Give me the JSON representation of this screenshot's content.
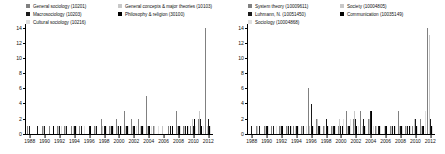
{
  "figure": {
    "panels": [
      {
        "name": "left-panel",
        "legend": [
          {
            "label": "General sociology (10201)",
            "color": "#808080"
          },
          {
            "label": "General concepts & major theories (10103)",
            "color": "#c8c8c8"
          },
          {
            "label": "Macrosociology (10203)",
            "color": "#1a1a1a"
          },
          {
            "label": "Philosophy & religion (30100)",
            "color": "#000000"
          },
          {
            "label": "Cultural sociology (10216)",
            "color": "#e0e0e0"
          }
        ],
        "chart_data": {
          "type": "bar",
          "title": "",
          "xlabel": "",
          "ylabel": "",
          "ylim": [
            0,
            14.5
          ],
          "yticks": [
            0,
            2,
            4,
            6,
            8,
            10,
            12,
            14
          ],
          "grid": false,
          "legend_position": "top",
          "categories": [
            1988,
            1989,
            1990,
            1991,
            1992,
            1993,
            1994,
            1995,
            1996,
            1997,
            1998,
            1999,
            2000,
            2001,
            2002,
            2003,
            2004,
            2005,
            2006,
            2007,
            2008,
            2009,
            2010,
            2011,
            2012
          ],
          "series": [
            {
              "name": "General sociology (10201)",
              "color": "#808080",
              "values": [
                1,
                0,
                1,
                1,
                1,
                1,
                1,
                1,
                0,
                1,
                2,
                1,
                2,
                3,
                2,
                2,
                5,
                1,
                0,
                1,
                3,
                1,
                1,
                2,
                14
              ]
            },
            {
              "name": "General concepts & major theories (10103)",
              "color": "#c8c8c8",
              "values": [
                0,
                0,
                1,
                0,
                1,
                1,
                1,
                0,
                0,
                1,
                1,
                1,
                1,
                1,
                1,
                1,
                1,
                1,
                1,
                0,
                1,
                1,
                2,
                3,
                1
              ]
            },
            {
              "name": "Macrosociology (10203)",
              "color": "#1a1a1a",
              "values": [
                1,
                1,
                1,
                0,
                1,
                1,
                1,
                1,
                1,
                1,
                1,
                1,
                1,
                1,
                1,
                1,
                1,
                0,
                0,
                1,
                1,
                1,
                1,
                2,
                2
              ]
            },
            {
              "name": "Philosophy & religion (30100)",
              "color": "#000000",
              "values": [
                0,
                0,
                0,
                1,
                0,
                0,
                1,
                0,
                1,
                0,
                1,
                1,
                1,
                1,
                1,
                1,
                1,
                0,
                0,
                1,
                1,
                1,
                2,
                1,
                1
              ]
            },
            {
              "name": "Cultural sociology (10216)",
              "color": "#e0e0e0",
              "values": [
                0,
                0,
                0,
                0,
                1,
                0,
                1,
                1,
                0,
                0,
                1,
                1,
                1,
                1,
                1,
                1,
                1,
                1,
                0,
                0,
                1,
                1,
                1,
                1,
                1
              ]
            }
          ]
        },
        "xticks": [
          1988,
          1990,
          1992,
          1994,
          1996,
          1998,
          2000,
          2002,
          2004,
          2006,
          2008,
          2010,
          2012
        ]
      },
      {
        "name": "right-panel",
        "legend": [
          {
            "label": "System theory (10009611)",
            "color": "#808080"
          },
          {
            "label": "Society (10004805)",
            "color": "#c8c8c8"
          },
          {
            "label": "Luhmann, N. (10051450)",
            "color": "#1a1a1a"
          },
          {
            "label": "Communication (10035149)",
            "color": "#000000"
          },
          {
            "label": "Sociology (10004868)",
            "color": "#e0e0e0"
          }
        ],
        "chart_data": {
          "type": "bar",
          "title": "",
          "xlabel": "",
          "ylabel": "",
          "ylim": [
            0,
            14.5
          ],
          "yticks": [
            0,
            2,
            4,
            6,
            8,
            10,
            12,
            14
          ],
          "grid": false,
          "legend_position": "top",
          "categories": [
            1988,
            1989,
            1990,
            1991,
            1992,
            1993,
            1994,
            1995,
            1996,
            1997,
            1998,
            1999,
            2000,
            2001,
            2002,
            2003,
            2004,
            2005,
            2006,
            2007,
            2008,
            2009,
            2010,
            2011,
            2012
          ],
          "series": [
            {
              "name": "System theory (10009611)",
              "color": "#808080",
              "values": [
                0,
                1,
                1,
                1,
                1,
                1,
                1,
                1,
                6,
                2,
                1,
                1,
                1,
                3,
                2,
                3,
                2,
                1,
                0,
                1,
                3,
                1,
                1,
                2,
                14
              ]
            },
            {
              "name": "Society (10004805)",
              "color": "#c8c8c8",
              "values": [
                0,
                1,
                1,
                0,
                1,
                1,
                1,
                1,
                1,
                2,
                1,
                1,
                2,
                1,
                3,
                1,
                2,
                1,
                1,
                1,
                1,
                1,
                2,
                1,
                13
              ]
            },
            {
              "name": "Luhmann, N. (10051450)",
              "color": "#1a1a1a",
              "values": [
                1,
                1,
                1,
                1,
                1,
                1,
                1,
                1,
                4,
                1,
                2,
                1,
                1,
                1,
                2,
                2,
                3,
                1,
                1,
                1,
                1,
                1,
                2,
                1,
                2
              ]
            },
            {
              "name": "Communication (10035149)",
              "color": "#000000",
              "values": [
                0,
                0,
                1,
                0,
                1,
                1,
                1,
                0,
                1,
                1,
                1,
                1,
                1,
                1,
                1,
                1,
                3,
                1,
                1,
                1,
                1,
                1,
                1,
                1,
                1
              ]
            },
            {
              "name": "Sociology (10004868)",
              "color": "#e0e0e0",
              "values": [
                0,
                0,
                1,
                1,
                0,
                1,
                1,
                1,
                1,
                1,
                1,
                1,
                2,
                2,
                1,
                1,
                1,
                1,
                0,
                1,
                1,
                1,
                1,
                3,
                1
              ]
            }
          ]
        },
        "xticks": [
          1988,
          1990,
          1992,
          1994,
          1996,
          1998,
          2000,
          2002,
          2004,
          2006,
          2008,
          2010,
          2012
        ]
      }
    ]
  }
}
